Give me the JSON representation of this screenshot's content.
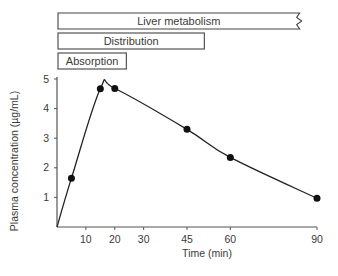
{
  "chart_data": {
    "type": "line",
    "title": "",
    "xlabel": "Time (min)",
    "ylabel": "Plasma concentration (µg/mL)",
    "xlim": [
      0,
      90
    ],
    "ylim": [
      0,
      5
    ],
    "x_ticks": [
      10,
      20,
      30,
      45,
      60,
      90
    ],
    "y_ticks": [
      1,
      2,
      3,
      4,
      5
    ],
    "grid": false,
    "series": [
      {
        "name": "Plasma concentration",
        "x": [
          0,
          5,
          15,
          20,
          45,
          60,
          90
        ],
        "y": [
          0,
          1.65,
          4.67,
          4.68,
          3.3,
          2.35,
          0.97
        ],
        "markers_at": [
          5,
          15,
          20,
          45,
          60,
          90
        ],
        "color": "#222222"
      }
    ],
    "phases": [
      {
        "label": "Liver metabolism",
        "start": 0,
        "end": 84,
        "continues": true
      },
      {
        "label": "Distribution",
        "start": 0,
        "end": 51,
        "continues": false
      },
      {
        "label": "Absorption",
        "start": 0,
        "end": 24,
        "continues": false
      }
    ]
  }
}
